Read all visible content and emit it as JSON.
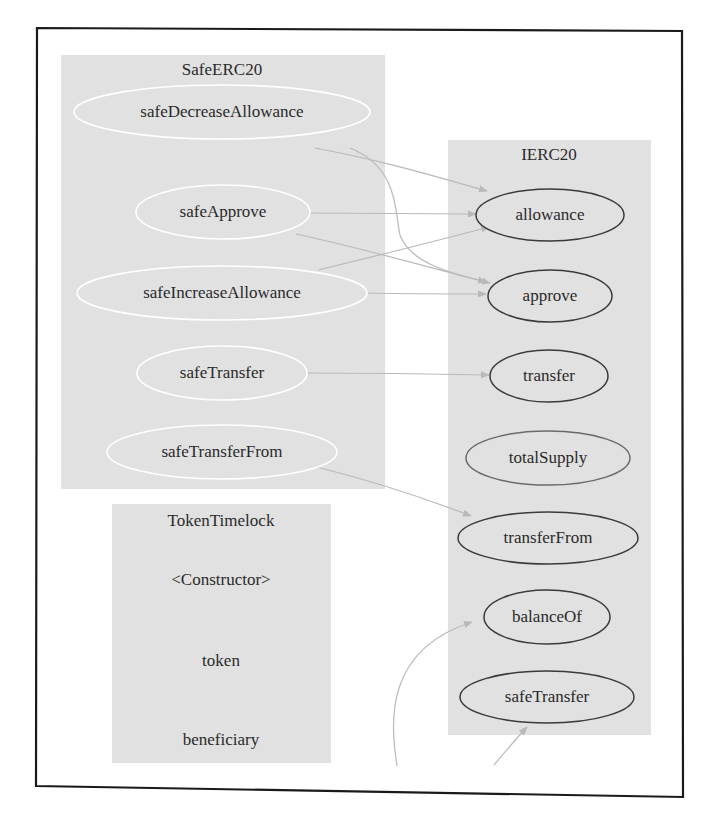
{
  "diagram": {
    "type": "call-graph",
    "colors": {
      "cluster_fill": "#e1e1e1",
      "frame": "#1a1a1a",
      "edge": "#b9b9b9",
      "source_node_stroke": "#ffffff",
      "target_node_stroke": "#3a3a3a",
      "text": "#2a2a2a"
    },
    "clusters": {
      "safeerc20": {
        "title": "SafeERC20",
        "nodes": {
          "safeDecreaseAllowance": "safeDecreaseAllowance",
          "safeApprove": "safeApprove",
          "safeIncreaseAllowance": "safeIncreaseAllowance",
          "safeTransfer": "safeTransfer",
          "safeTransferFrom": "safeTransferFrom"
        }
      },
      "ierc20": {
        "title": "IERC20",
        "nodes": {
          "allowance": "allowance",
          "approve": "approve",
          "transfer": "transfer",
          "totalSupply": "totalSupply",
          "transferFrom": "transferFrom",
          "balanceOf": "balanceOf",
          "safeTransfer": "safeTransfer"
        }
      },
      "tokentimelock": {
        "title": "TokenTimelock",
        "nodes": {
          "constructor": "<Constructor>",
          "token": "token",
          "beneficiary": "beneficiary"
        }
      }
    },
    "edges": [
      {
        "from": "SafeERC20.safeDecreaseAllowance",
        "to": "IERC20.allowance"
      },
      {
        "from": "SafeERC20.safeDecreaseAllowance",
        "to": "IERC20.approve"
      },
      {
        "from": "SafeERC20.safeApprove",
        "to": "IERC20.allowance"
      },
      {
        "from": "SafeERC20.safeApprove",
        "to": "IERC20.approve"
      },
      {
        "from": "SafeERC20.safeIncreaseAllowance",
        "to": "IERC20.allowance"
      },
      {
        "from": "SafeERC20.safeIncreaseAllowance",
        "to": "IERC20.approve"
      },
      {
        "from": "SafeERC20.safeTransfer",
        "to": "IERC20.transfer"
      },
      {
        "from": "SafeERC20.safeTransferFrom",
        "to": "IERC20.transferFrom"
      },
      {
        "from": "(off-frame)",
        "to": "IERC20.balanceOf"
      },
      {
        "from": "(off-frame)",
        "to": "IERC20.safeTransfer"
      }
    ]
  }
}
